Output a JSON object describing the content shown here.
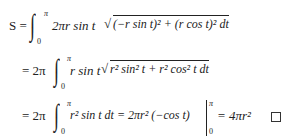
{
  "equations": {
    "line1": {
      "lhs": "S =",
      "upper": "π",
      "lower": "0",
      "integrand_a": "2πr sin t",
      "radicand": "(−r sin t)² + (r cos t)² dt"
    },
    "line2": {
      "prefix": "= 2π",
      "upper": "π",
      "lower": "0",
      "integrand_a": "r sin t",
      "radicand": "r² sin² t + r² cos² t dt"
    },
    "line3": {
      "prefix": "= 2π",
      "upper": "π",
      "lower": "0",
      "integrand": "r² sin t dt = 2πr² (−cos t)",
      "eval_upper": "π",
      "eval_lower": "0",
      "result": "= 4πr²",
      "qed": "□"
    }
  }
}
